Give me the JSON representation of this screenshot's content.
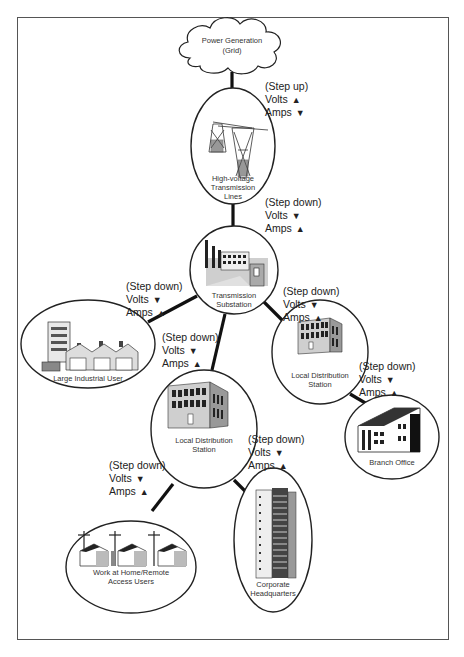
{
  "diagram": {
    "nodes": {
      "grid": {
        "label_line1": "Power Generation",
        "label_line2": "(Grid)",
        "icon": "cloud-icon"
      },
      "hv_lines": {
        "label_line1": "High-voltage",
        "label_line2": "Transmission",
        "label_line3": "Lines",
        "icon": "transmission-tower-icon"
      },
      "substation": {
        "label_line1": "Transmission",
        "label_line2": "Substation",
        "icon": "power-plant-icon"
      },
      "industrial": {
        "label_line1": "Large Industrial User",
        "icon": "factory-icon"
      },
      "local_right": {
        "label_line1": "Local Distribution",
        "label_line2": "Station",
        "icon": "office-building-icon"
      },
      "local_center": {
        "label_line1": "Local Distribution",
        "label_line2": "Station",
        "icon": "office-building-icon"
      },
      "branch": {
        "label_line1": "Branch Office",
        "icon": "branch-office-building-icon"
      },
      "hq": {
        "label_line1": "Corporate",
        "label_line2": "Headquarters",
        "icon": "skyscraper-icon"
      },
      "home": {
        "label_line1": "Work at Home/Remote",
        "label_line2": "Access Users",
        "icon": "houses-icon"
      }
    },
    "annotations": {
      "grid_to_hv": {
        "mode": "(Step up)",
        "volts": "Volts",
        "volts_dir": "▲",
        "amps": "Amps",
        "amps_dir": "▼"
      },
      "hv_to_sub": {
        "mode": "(Step down)",
        "volts": "Volts",
        "volts_dir": "▼",
        "amps": "Amps",
        "amps_dir": "▲"
      },
      "sub_to_industrial": {
        "mode": "(Step down)",
        "volts": "Volts",
        "volts_dir": "▼",
        "amps": "Amps",
        "amps_dir": "▲"
      },
      "sub_to_local_right": {
        "mode": "(Step down)",
        "volts": "Volts",
        "volts_dir": "▼",
        "amps": "Amps",
        "amps_dir": "▲"
      },
      "sub_to_local_center": {
        "mode": "(Step down)",
        "volts": "Volts",
        "volts_dir": "▼",
        "amps": "Amps",
        "amps_dir": "▲"
      },
      "local_right_to_branch": {
        "mode": "(Step down)",
        "volts": "Volts",
        "volts_dir": "▼",
        "amps": "Amps",
        "amps_dir": "▲"
      },
      "local_center_to_hq": {
        "mode": "(Step down)",
        "volts": "Volts",
        "volts_dir": "▼",
        "amps": "Amps",
        "amps_dir": "▲"
      },
      "local_center_to_home": {
        "mode": "(Step down)",
        "volts": "Volts",
        "volts_dir": "▼",
        "amps": "Amps",
        "amps_dir": "▲"
      }
    }
  }
}
